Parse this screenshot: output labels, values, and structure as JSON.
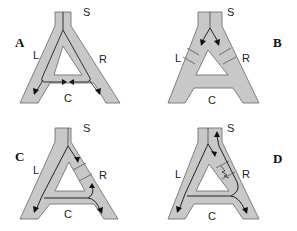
{
  "figure": {
    "fill_color": "#c8c8c8",
    "stroke_color": "#555555",
    "panels": [
      {
        "id": "A",
        "letter": "A",
        "labels": {
          "stem": "S",
          "left": "L",
          "right": "R",
          "crossbar": "C"
        },
        "description": "Flow from S splits down both L and R arms, meets at crossbar C, and exits both lower legs"
      },
      {
        "id": "B",
        "letter": "B",
        "labels": {
          "stem": "S",
          "left": "L",
          "right": "R",
          "crossbar": "C"
        },
        "description": "Both L and R arms blocked by partitions; arrows from S point into each arm"
      },
      {
        "id": "C",
        "letter": "C",
        "labels": {
          "stem": "S",
          "left": "L",
          "right": "R",
          "crossbar": "C"
        },
        "description": "R arm blocked; flow from S enters R, returns via C to left leg; right leg flow loops back up and out"
      },
      {
        "id": "D",
        "letter": "D",
        "labels": {
          "stem": "S",
          "left": "L",
          "right": "R",
          "crossbar": "C"
        },
        "description": "R arm partially blocked (zigzag); flow goes from S down L around C, partially back up R to S and out right leg"
      }
    ]
  }
}
